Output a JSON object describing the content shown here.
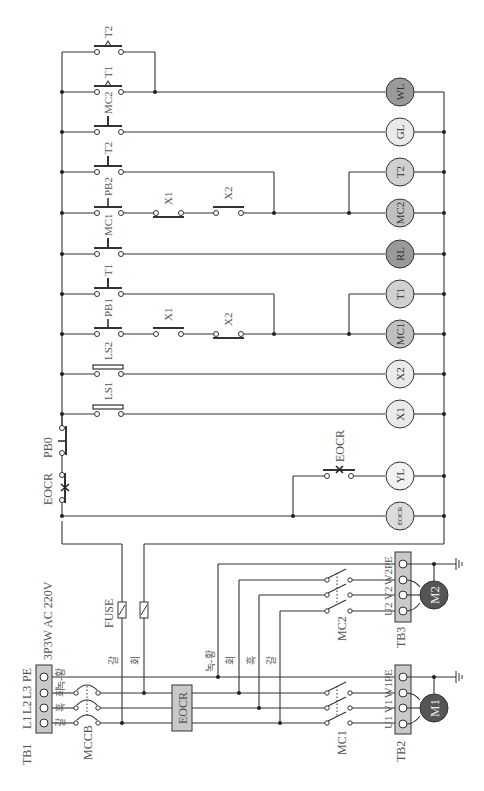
{
  "diagram": {
    "type": "electrical control ladder diagram (rotated 90°)",
    "power_supply": {
      "label": "3P3W AC 220V",
      "terminal_block": "TB1",
      "terminals": [
        "L1",
        "L2",
        "L3",
        "PE"
      ],
      "wire_colors": [
        "갈",
        "흑",
        "회",
        "녹-황"
      ],
      "breaker": "MCCB",
      "overload": "EOCR",
      "fuse_label": "FUSE",
      "fuse_wire_colors": [
        "갈",
        "회"
      ],
      "branch_wire_colors": [
        "녹-황",
        "회",
        "흑",
        "갈"
      ]
    },
    "motors": [
      {
        "name": "M1",
        "contactor": "MC1",
        "terminal_block": "TB2",
        "terminals": [
          "U1",
          "V1",
          "W1",
          "PE"
        ]
      },
      {
        "name": "M2",
        "contactor": "MC2",
        "terminal_block": "TB3",
        "terminals": [
          "U2",
          "V2",
          "W2",
          "PE"
        ]
      }
    ],
    "common_contacts": {
      "eocr": "EOCR",
      "stop": "PB0"
    },
    "rungs": [
      {
        "id": "wl",
        "contacts": [
          "MC2",
          "T1 (NC)",
          "T2 (NC, parallel)"
        ],
        "load": "WL"
      },
      {
        "id": "gl",
        "contacts": [
          "MC2"
        ],
        "load": "GL"
      },
      {
        "id": "t2",
        "contacts": [
          "T2"
        ],
        "load": "T2"
      },
      {
        "id": "mc2",
        "contacts": [
          "PB2",
          "X1 (NC)",
          "X2"
        ],
        "load": "MC2"
      },
      {
        "id": "rl",
        "contacts": [
          "MC1"
        ],
        "load": "RL"
      },
      {
        "id": "t1",
        "contacts": [
          "T1"
        ],
        "load": "T1"
      },
      {
        "id": "mc1",
        "contacts": [
          "PB1",
          "X1",
          "X2 (NC)"
        ],
        "load": "MC1"
      },
      {
        "id": "x2",
        "contacts": [
          "LS2"
        ],
        "load": "X2"
      },
      {
        "id": "x1",
        "contacts": [
          "LS1"
        ],
        "load": "X1"
      },
      {
        "id": "yl",
        "contacts": [
          "EOCR (NO)"
        ],
        "load": "YL"
      },
      {
        "id": "eocr",
        "contacts": [],
        "load": "EOCR"
      }
    ]
  },
  "labels": {
    "supply": "3P3W AC 220V",
    "tb1": "TB1",
    "tb2": "TB2",
    "tb3": "TB3",
    "l1": "L1",
    "l2": "L2",
    "l3": "L3",
    "pe": "PE",
    "mccb": "MCCB",
    "eocr_box": "EOCR",
    "fuse": "FUSE",
    "mc1": "MC1",
    "mc2": "MC2",
    "m1": "M1",
    "m2": "M2",
    "u1": "U1",
    "v1": "V1",
    "w1": "W1",
    "u2": "U2",
    "v2": "V2",
    "w2": "W2",
    "wc_brown": "갈",
    "wc_black": "흑",
    "wc_gray": "회",
    "wc_gy": "녹-황",
    "eocr_c": "EOCR",
    "pb0": "PB0",
    "c_mc2_wl": "MC2",
    "c_t1_wl": "T1",
    "c_t2_wl": "T2",
    "c_mc1_gl": "MC1",
    "c_t2": "T2",
    "c_pb2": "PB2",
    "c_x1_b": "X1",
    "c_x2_b": "X2",
    "c_t1": "T1",
    "c_pb1": "PB1",
    "c_x1_a": "X1",
    "c_x2_a": "X2",
    "c_ls2": "LS2",
    "c_ls1": "LS1",
    "c_eocr_yl": "EOCR",
    "lamp_wl": "WL",
    "lamp_gl": "GL",
    "coil_t2": "T2",
    "coil_mc2": "MC2",
    "lamp_rl": "RL",
    "coil_t1": "T1",
    "coil_mc1": "MC1",
    "coil_x2": "X2",
    "coil_x1": "X1",
    "lamp_yl": "YL",
    "coil_eocr": "EOCR"
  },
  "colors": {
    "wire": "#333333",
    "lamp_dark": "#9a9a9a",
    "lamp_mid": "#c8c8c8",
    "lamp_light": "#e6e6e6",
    "motor": "#555555",
    "terminal_block": "#c9c9c9"
  }
}
